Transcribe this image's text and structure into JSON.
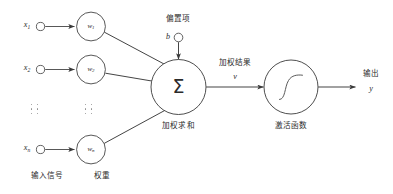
{
  "diagram": {
    "stroke_color": "#3a3a3a",
    "text_color": "#2b2b2b",
    "background": "#ffffff"
  },
  "inputs": [
    {
      "name": "x1",
      "label": "x",
      "sub": "1"
    },
    {
      "name": "x2",
      "label": "x",
      "sub": "2"
    },
    {
      "name": "xn",
      "label": "x",
      "sub": "n"
    }
  ],
  "weights": [
    {
      "name": "w1",
      "label": "w",
      "sub": "1"
    },
    {
      "name": "w2",
      "label": "w",
      "sub": "2"
    },
    {
      "name": "wn",
      "label": "w",
      "sub": "n"
    }
  ],
  "bias": {
    "caption": "偏置项",
    "symbol": "b"
  },
  "sum_node": {
    "symbol": "Σ",
    "caption": "加权求和"
  },
  "weighted_result": {
    "caption": "加权结果",
    "symbol": "v"
  },
  "activation": {
    "caption": "激活函数"
  },
  "output": {
    "caption": "输出",
    "symbol": "y"
  },
  "column_captions": {
    "input_signal": "输入信号",
    "weight": "权重"
  },
  "ellipsis": {
    "input_column": "⋮ ⋮",
    "weight_column": "⋮ ⋮"
  }
}
